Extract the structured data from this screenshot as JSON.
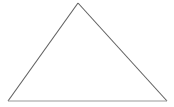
{
  "canvas": {
    "width": 174,
    "height": 107,
    "background_color": "#ffffff"
  },
  "figure": {
    "name": "triangle",
    "type": "polygon",
    "label": "triangle",
    "filled": false,
    "fill_color": "#ffffff",
    "vertices": [
      {
        "name": "apex",
        "x": 78,
        "y": 3
      },
      {
        "name": "bottom-right",
        "x": 167,
        "y": 101
      },
      {
        "name": "bottom-left",
        "x": 8,
        "y": 101
      }
    ],
    "points_attr": "78,3 167,101 8,101",
    "edges": [
      {
        "name": "left-side",
        "from": "bottom-left",
        "to": "apex",
        "x1": 8,
        "y1": 101,
        "x2": 78,
        "y2": 3,
        "stroke_color": "#606060",
        "stroke_width": 1.1
      },
      {
        "name": "right-side",
        "from": "apex",
        "to": "bottom-right",
        "x1": 78,
        "y1": 3,
        "x2": 167,
        "y2": 101,
        "stroke_color": "#606060",
        "stroke_width": 1.1
      },
      {
        "name": "base",
        "from": "bottom-left",
        "to": "bottom-right",
        "x1": 8,
        "y1": 101,
        "x2": 167,
        "y2": 101,
        "stroke_color": "#9a9a9a",
        "stroke_width": 1.2
      }
    ]
  },
  "annotations": {
    "labels": [],
    "text": ""
  }
}
